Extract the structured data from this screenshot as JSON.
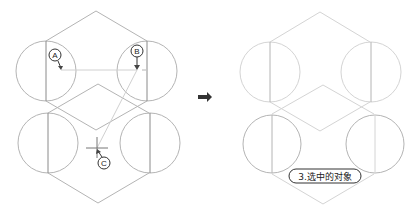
{
  "callouts": {
    "a": "A",
    "b": "B",
    "c": "C"
  },
  "result_label": "3.选中的对象",
  "colors": {
    "line": "#b4b4b4",
    "selected_line": "#d4d4d4",
    "arrow": "#444444"
  }
}
